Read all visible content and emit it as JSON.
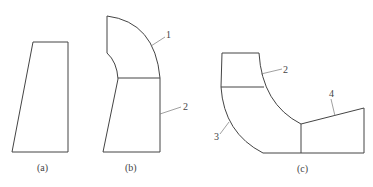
{
  "figures": [
    {
      "id": "a",
      "caption": "(a)"
    },
    {
      "id": "b",
      "caption": "(b)",
      "callouts": [
        "1",
        "2"
      ]
    },
    {
      "id": "c",
      "caption": "(c)",
      "callouts": [
        "2",
        "3",
        "4"
      ]
    }
  ],
  "colors": {
    "stroke": "#444444",
    "background": "#ffffff"
  }
}
